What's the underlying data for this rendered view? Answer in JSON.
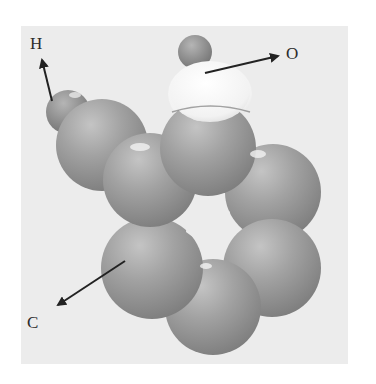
{
  "figure": {
    "caption_fragment": "",
    "labels": {
      "hydrogen": "H",
      "oxygen": "O",
      "carbon": "C"
    },
    "colors": {
      "background": "#ececec",
      "carbon_atom": "#9a9a9a",
      "hydrogen_atom": "#8f8f8f",
      "oxygen_atom": "#f4f4f4",
      "arrow": "#222222"
    }
  }
}
